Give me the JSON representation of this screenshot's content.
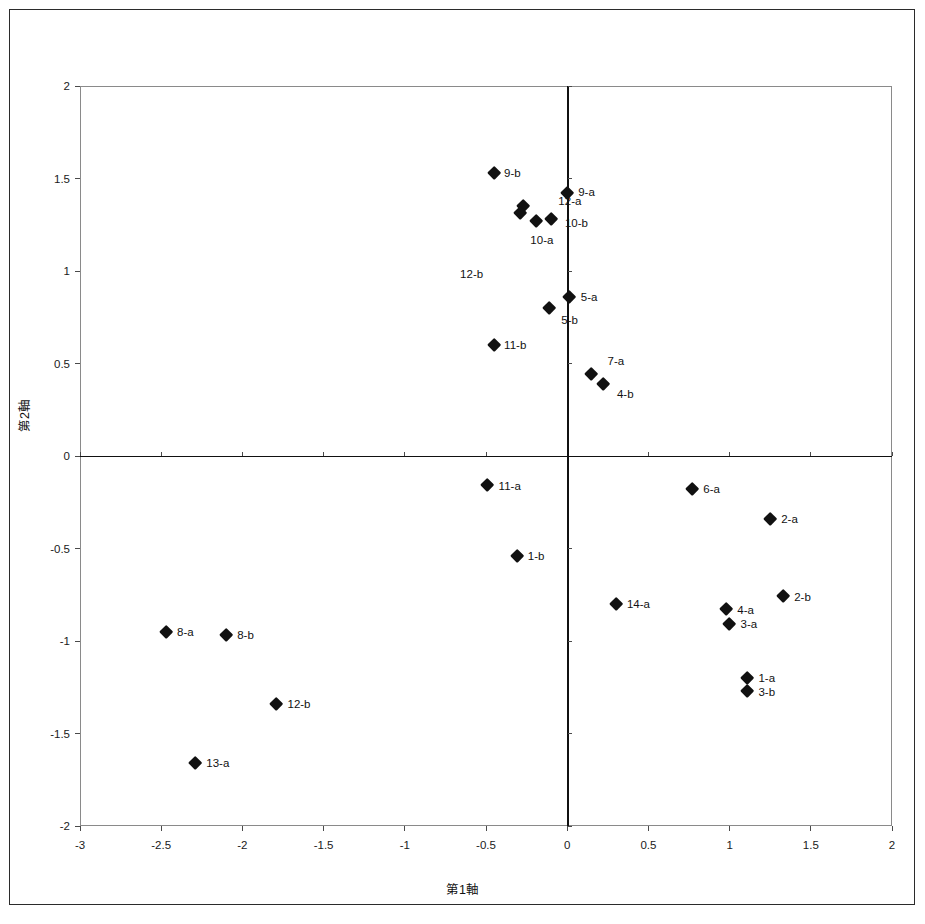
{
  "chart_data": {
    "type": "scatter",
    "title": "",
    "xlabel": "第1軸",
    "ylabel": "第2軸",
    "xlim": [
      -3,
      2
    ],
    "ylim": [
      -2,
      2
    ],
    "grid": false,
    "legend": "none",
    "xticks": [
      "-3",
      "-2.5",
      "-2",
      "-1.5",
      "-1",
      "-0.5",
      "0",
      "0.5",
      "1",
      "1.5",
      "2"
    ],
    "xtick_values": [
      -3,
      -2.5,
      -2,
      -1.5,
      -1,
      -0.5,
      0,
      0.5,
      1,
      1.5,
      2
    ],
    "yticks": [
      "2",
      "1.5",
      "1",
      "0.5",
      "0",
      "-0.5",
      "-1",
      "-1.5",
      "-2"
    ],
    "ytick_values": [
      2,
      1.5,
      1,
      0.5,
      0,
      -0.5,
      -1,
      -1.5,
      -2
    ],
    "marker": "diamond",
    "marker_color": "#111111",
    "points": [
      {
        "label": "9-b",
        "x": -0.45,
        "y": 1.53,
        "lx": 10,
        "ly": 0
      },
      {
        "label": "9-a",
        "x": 0.0,
        "y": 1.42,
        "lx": 11,
        "ly": -1
      },
      {
        "label": "12-a",
        "x": -0.27,
        "y": 1.35,
        "lx": 35,
        "ly": -5
      },
      {
        "label": "12-b",
        "x": -0.29,
        "y": 1.31,
        "lx": -60,
        "ly": 60
      },
      {
        "label": "10-b",
        "x": -0.1,
        "y": 1.28,
        "lx": 14,
        "ly": 4
      },
      {
        "label": "10-a",
        "x": -0.19,
        "y": 1.27,
        "lx": -6,
        "ly": 19
      },
      {
        "label": "5-a",
        "x": 0.01,
        "y": 0.86,
        "lx": 12,
        "ly": 0
      },
      {
        "label": "5-b",
        "x": -0.11,
        "y": 0.8,
        "lx": 12,
        "ly": 12
      },
      {
        "label": "11-b",
        "x": -0.45,
        "y": 0.6,
        "lx": 10,
        "ly": 0
      },
      {
        "label": "7-a",
        "x": 0.15,
        "y": 0.44,
        "lx": 16,
        "ly": -14
      },
      {
        "label": "4-b",
        "x": 0.22,
        "y": 0.39,
        "lx": 14,
        "ly": 10
      },
      {
        "label": "11-a",
        "x": -0.49,
        "y": -0.16,
        "lx": 11,
        "ly": 0
      },
      {
        "label": "6-a",
        "x": 0.77,
        "y": -0.18,
        "lx": 11,
        "ly": 0
      },
      {
        "label": "2-a",
        "x": 1.25,
        "y": -0.34,
        "lx": 11,
        "ly": 0
      },
      {
        "label": "1-b",
        "x": -0.31,
        "y": -0.54,
        "lx": 11,
        "ly": 0
      },
      {
        "label": "2-b",
        "x": 1.33,
        "y": -0.76,
        "lx": 11,
        "ly": 0
      },
      {
        "label": "14-a",
        "x": 0.3,
        "y": -0.8,
        "lx": 11,
        "ly": 0
      },
      {
        "label": "4-a",
        "x": 0.98,
        "y": -0.83,
        "lx": 11,
        "ly": 0
      },
      {
        "label": "3-a",
        "x": 1.0,
        "y": -0.91,
        "lx": 11,
        "ly": 0
      },
      {
        "label": "8-a",
        "x": -2.47,
        "y": -0.95,
        "lx": 11,
        "ly": 0
      },
      {
        "label": "8-b",
        "x": -2.1,
        "y": -0.97,
        "lx": 11,
        "ly": 0
      },
      {
        "label": "1-a",
        "x": 1.11,
        "y": -1.2,
        "lx": 11,
        "ly": 0
      },
      {
        "label": "3-b",
        "x": 1.11,
        "y": -1.27,
        "lx": 11,
        "ly": 1
      },
      {
        "label": "12-b",
        "x": -1.79,
        "y": -1.34,
        "lx": 11,
        "ly": 0
      },
      {
        "label": "13-a",
        "x": -2.29,
        "y": -1.66,
        "lx": 11,
        "ly": 0
      }
    ]
  }
}
